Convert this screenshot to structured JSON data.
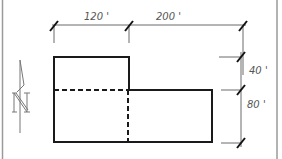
{
  "diagram": {
    "type": "site-plan",
    "colors": {
      "outline": "#1a1a1a",
      "dimension": "#6a6a6a",
      "border": "#9a9a9a",
      "label": "#555555"
    },
    "dimensions": {
      "top_left": "120 '",
      "top_right": "200 '",
      "right_upper": "40 '",
      "right_lower": "80 '"
    },
    "north_arrow": {
      "label": "N"
    }
  }
}
